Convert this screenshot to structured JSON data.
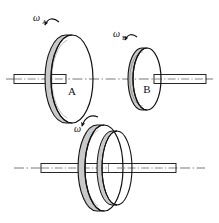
{
  "figure": {
    "background_color": "#ffffff",
    "line_color": "#111111",
    "rim_fill_color": "#c9c9c9",
    "face_fill_color": "#ffffff",
    "shaft_fill_color": "#ffffff",
    "centerline_color": "#555555"
  },
  "upper_assembly": {
    "disc_a": {
      "label": "A",
      "omega_label": "ω",
      "omega_subscript": "A",
      "center_x": 72,
      "center_y": 79,
      "radius_x": 21,
      "radius_y": 44,
      "rim_thickness": 6
    },
    "disc_b": {
      "label": "B",
      "omega_label": "ω",
      "omega_subscript": "B",
      "center_x": 147,
      "center_y": 79,
      "radius_x": 14,
      "radius_y": 31,
      "rim_thickness": 5
    },
    "shaft_left": {
      "name": "shaft-left",
      "x": 14,
      "y": 74,
      "width": 52,
      "height": 9
    },
    "shaft_right": {
      "name": "shaft-right",
      "x": 154,
      "y": 74,
      "width": 52,
      "height": 9
    },
    "centerline_y": 79
  },
  "lower_assembly": {
    "omega_label": "ω",
    "omega_subscript": "",
    "disc_a": {
      "center_x": 104,
      "center_y": 168,
      "radius_x": 19,
      "radius_y": 43,
      "rim_thickness": 7
    },
    "disc_b": {
      "center_x": 117,
      "center_y": 168,
      "radius_x": 15,
      "radius_y": 37,
      "rim_thickness": 5
    },
    "shaft_left": {
      "name": "shaft-left-lower",
      "x": 41,
      "y": 163,
      "width": 68,
      "height": 9
    },
    "shaft_right": {
      "name": "shaft-right-lower",
      "x": 114,
      "y": 163,
      "width": 62,
      "height": 9
    },
    "centerline_y": 168
  },
  "labels": {
    "omega_a": "ω",
    "omega_a_sub": "A",
    "omega_b": "ω",
    "omega_b_sub": "B",
    "omega_c": "ω",
    "disc_a": "A",
    "disc_b": "B"
  }
}
